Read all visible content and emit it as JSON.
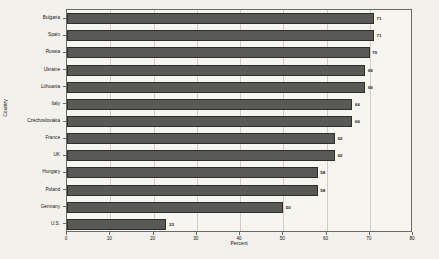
{
  "chart_data": {
    "type": "bar",
    "orientation": "horizontal",
    "title": "",
    "xlabel": "Percent",
    "ylabel": "Country",
    "xlim": [
      0,
      80
    ],
    "xticks": [
      0,
      10,
      20,
      30,
      40,
      50,
      60,
      70,
      80
    ],
    "grid": true,
    "legend": false,
    "categories": [
      "Bulgaria",
      "Spain",
      "Russia",
      "Ukraine",
      "Lithuania",
      "Italy",
      "Czechoslovakia",
      "France",
      "UK",
      "Hungary",
      "Poland",
      "Germany",
      "U.S."
    ],
    "values": [
      71,
      71,
      70,
      69,
      69,
      66,
      66,
      62,
      62,
      58,
      58,
      50,
      23
    ],
    "value_labels": [
      "71",
      "71",
      "70",
      "69",
      "69",
      "66",
      "66",
      "62",
      "62",
      "58",
      "58",
      "50",
      "23"
    ],
    "bar_color": "#595955",
    "bar_edge_color": "#2e2e2b",
    "plot_background": "#f7f5f0",
    "figure_background": "#f3f1ec"
  }
}
